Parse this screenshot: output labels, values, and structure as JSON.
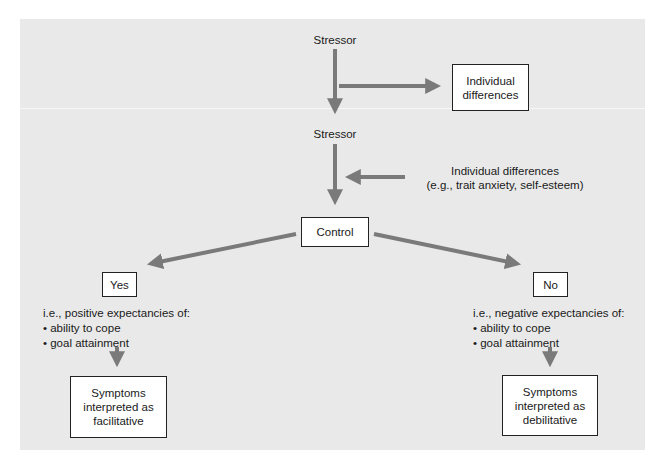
{
  "diagram": {
    "colors": {
      "background": "#e9e9e9",
      "arrow": "#7a7a7a",
      "box_fill": "#ffffff",
      "box_border": "#222222"
    },
    "nodes": {
      "stressor_top": "Stressor",
      "individual_differences_box": "Individual differences",
      "stressor_second": "Stressor",
      "individual_differences_note": {
        "line1": "Individual differences",
        "line2": "(e.g., trait anxiety, self-esteem)"
      },
      "control": "Control",
      "yes": "Yes",
      "no": "No",
      "yes_expectancies": {
        "heading": "i.e., positive expectancies of:",
        "items": [
          "• ability to cope",
          "• goal attainment"
        ]
      },
      "no_expectancies": {
        "heading": "i.e., negative expectancies of:",
        "items": [
          "• ability to cope",
          "• goal attainment"
        ]
      },
      "outcome_yes": "Symptoms interpreted as facilitative",
      "outcome_no": "Symptoms interpreted as debilitative"
    },
    "edges": [
      {
        "from": "stressor_top",
        "to": "stressor_second"
      },
      {
        "from": "stressor_top",
        "to": "individual_differences_box"
      },
      {
        "from": "individual_differences_note",
        "to": "control_path"
      },
      {
        "from": "stressor_second",
        "to": "control"
      },
      {
        "from": "control",
        "to": "yes"
      },
      {
        "from": "control",
        "to": "no"
      },
      {
        "from": "yes_expectancies",
        "to": "outcome_yes"
      },
      {
        "from": "no_expectancies",
        "to": "outcome_no"
      }
    ]
  }
}
